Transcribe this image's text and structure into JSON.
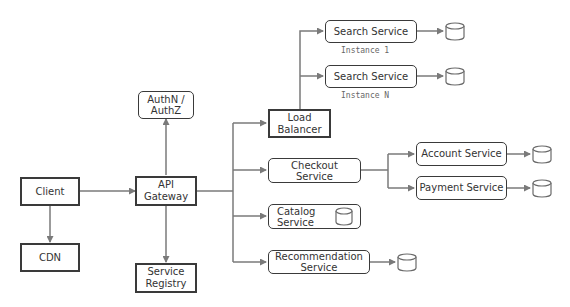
{
  "diagram": {
    "type": "architecture",
    "nodes": {
      "client": {
        "label": "Client"
      },
      "cdn": {
        "label": "CDN"
      },
      "api_gateway": {
        "label": "API Gateway",
        "line1": "API",
        "line2": "Gateway"
      },
      "auth": {
        "label": "AuthN / AuthZ",
        "line1": "AuthN /",
        "line2": "AuthZ"
      },
      "service_registry": {
        "label": "Service Registry",
        "line1": "Service",
        "line2": "Registry"
      },
      "load_balancer": {
        "label": "Load Balancer",
        "line1": "Load",
        "line2": "Balancer"
      },
      "search_1": {
        "label": "Search Service",
        "caption": "Instance 1"
      },
      "search_n": {
        "label": "Search Service",
        "caption": "Instance N"
      },
      "checkout": {
        "label": "Checkout Service",
        "line1": "Checkout",
        "line2": "Service"
      },
      "catalog": {
        "label": "Catalog Service",
        "line1": "Catalog",
        "line2": "Service"
      },
      "recommendation": {
        "label": "Recommendation Service",
        "line1": "Recommendation",
        "line2": "Service"
      },
      "account": {
        "label": "Account Service"
      },
      "payment": {
        "label": "Payment Service"
      }
    },
    "edges": [
      {
        "from": "Client",
        "to": "API Gateway"
      },
      {
        "from": "Client",
        "to": "CDN"
      },
      {
        "from": "API Gateway",
        "to": "AuthN / AuthZ"
      },
      {
        "from": "API Gateway",
        "to": "Service Registry"
      },
      {
        "from": "API Gateway",
        "to": "Load Balancer"
      },
      {
        "from": "API Gateway",
        "to": "Checkout Service"
      },
      {
        "from": "API Gateway",
        "to": "Catalog Service"
      },
      {
        "from": "API Gateway",
        "to": "Recommendation Service"
      },
      {
        "from": "Load Balancer",
        "to": "Search Service (Instance 1)"
      },
      {
        "from": "Load Balancer",
        "to": "Search Service (Instance N)"
      },
      {
        "from": "Checkout Service",
        "to": "Account Service"
      },
      {
        "from": "Checkout Service",
        "to": "Payment Service"
      },
      {
        "from": "Search Service (Instance 1)",
        "to": "database"
      },
      {
        "from": "Search Service (Instance N)",
        "to": "database"
      },
      {
        "from": "Recommendation Service",
        "to": "database"
      },
      {
        "from": "Account Service",
        "to": "database"
      },
      {
        "from": "Payment Service",
        "to": "database"
      }
    ],
    "icons": {
      "database": "database-cylinder-icon"
    },
    "colors": {
      "box_border": "#3a3a3a",
      "arrow": "#7a7a7a",
      "text": "#333333",
      "caption": "#666666"
    }
  }
}
